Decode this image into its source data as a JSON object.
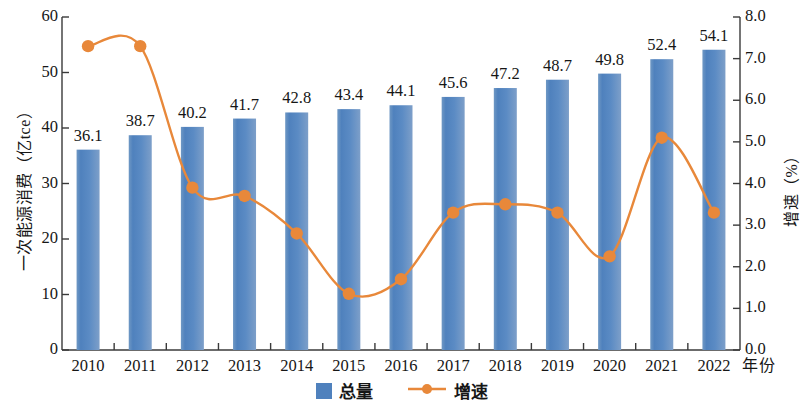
{
  "chart_data": {
    "type": "bar",
    "title": "",
    "xlabel": "年份",
    "ylabel": "一次能源消费（亿tce）",
    "ylabel_right": "增速（%）",
    "categories": [
      "2010",
      "2011",
      "2012",
      "2013",
      "2014",
      "2015",
      "2016",
      "2017",
      "2018",
      "2019",
      "2020",
      "2021",
      "2022"
    ],
    "ylim": [
      0,
      60
    ],
    "ylim_right": [
      0.0,
      8.0
    ],
    "ytick_labels": [
      "0",
      "10",
      "20",
      "30",
      "40",
      "50",
      "60"
    ],
    "ytick_labels_right": [
      "0.0",
      "1.0",
      "2.0",
      "3.0",
      "4.0",
      "5.0",
      "6.0",
      "7.0",
      "8.0"
    ],
    "grid": false,
    "legend_position": "bottom-center",
    "series": [
      {
        "name": "总量",
        "type": "bar",
        "axis": "left",
        "unit": "亿tce",
        "color": "#4f81bd",
        "values": [
          36.1,
          38.7,
          40.2,
          41.7,
          42.8,
          43.4,
          44.1,
          45.6,
          47.2,
          48.7,
          49.8,
          52.4,
          54.1
        ],
        "data_labels": [
          "36.1",
          "38.7",
          "40.2",
          "41.7",
          "42.8",
          "43.4",
          "44.1",
          "45.6",
          "47.2",
          "48.7",
          "49.8",
          "52.4",
          "54.1"
        ]
      },
      {
        "name": "增速",
        "type": "line",
        "axis": "right",
        "unit": "%",
        "color": "#e8883a",
        "marker": "circle",
        "values": [
          7.3,
          7.3,
          3.9,
          3.7,
          2.8,
          1.35,
          1.7,
          3.3,
          3.5,
          3.3,
          2.25,
          5.1,
          3.3
        ]
      }
    ]
  },
  "legend": {
    "items": [
      {
        "label": "总量",
        "marker": "bar-swatch",
        "color": "#4f81bd"
      },
      {
        "label": "增速",
        "marker": "line-circle",
        "color": "#e8883a"
      }
    ]
  }
}
